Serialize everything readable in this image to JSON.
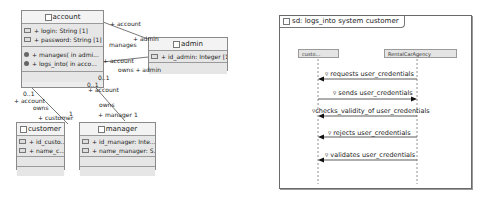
{
  "class_diagram": {
    "classes": [
      {
        "name": "account",
        "attributes": [
          "+ login: String [1]",
          "+ password: String [1] ("
        ],
        "operations": [
          "+ manages( in admi...",
          "+ logs_into( in acco..."
        ]
      },
      {
        "name": "admin",
        "attributes": [
          "+ id_admin: Integer [1]"
        ],
        "operations": []
      },
      {
        "name": "customer",
        "attributes": [
          "+ id_custo...",
          "+ name_c..."
        ],
        "operations": []
      },
      {
        "name": "manager",
        "attributes": [
          "+ id_manager: Inte...",
          "+ name_manager: S..."
        ],
        "operations": []
      }
    ],
    "association_labels": {
      "account_admin_top_role": "+ account",
      "account_admin_top_role_admin": "+ admin",
      "account_admin_top_name": "manages",
      "account_admin_bottom_role": "+ account",
      "account_admin_bottom_name": "owns + admin",
      "account_mult_1": "0..1",
      "account_mult_2": "0..1",
      "account_role_manager_side": "+ account",
      "customer_side_mult": "0..1",
      "customer_side_role": "+ account",
      "customer_side_name": "owns",
      "customer_role": "+ customer",
      "customer_mult": "1",
      "manager_side_name": "owns",
      "manager_role": "+ manager",
      "manager_mult": "1"
    }
  },
  "sequence_diagram": {
    "frame_title": "sd: logs_into system customer",
    "lifelines": [
      "custo...",
      "RentalCarAgency"
    ],
    "messages": [
      {
        "label": "requests user_credentials",
        "direction": "left"
      },
      {
        "label": "sends user_credentials",
        "direction": "right"
      },
      {
        "label": "checks_validity_of user_credentials",
        "direction": "left"
      },
      {
        "label": "rejects user_credentials",
        "direction": "left"
      },
      {
        "label": "validates user_credentials",
        "direction": "left"
      }
    ]
  }
}
